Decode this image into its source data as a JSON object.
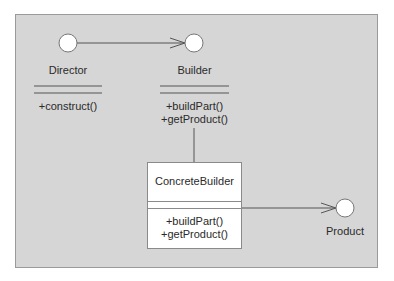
{
  "diagram": {
    "colors": {
      "panel_bg": "#d6d6d6",
      "panel_border": "#9a9a9a",
      "line": "#555555",
      "circle_fill": "#ffffff",
      "box_fill": "#ffffff"
    },
    "classes": [
      {
        "name": "Director",
        "methods": [
          "+construct()"
        ]
      },
      {
        "name": "Builder",
        "methods": [
          "+buildPart()",
          "+getProduct()"
        ]
      },
      {
        "name": "ConcreteBuilder",
        "methods": [
          "+buildPart()",
          "+getProduct()"
        ]
      },
      {
        "name": "Product",
        "methods": []
      }
    ],
    "relations": [
      {
        "from": "Director",
        "to": "Builder",
        "type": "association-arrow"
      },
      {
        "from": "ConcreteBuilder",
        "to": "Builder",
        "type": "line"
      },
      {
        "from": "ConcreteBuilder",
        "to": "Product",
        "type": "association-arrow"
      }
    ]
  }
}
